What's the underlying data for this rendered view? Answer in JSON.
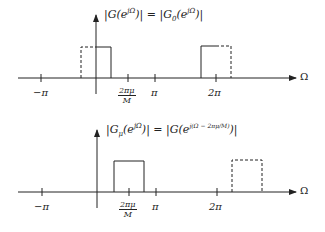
{
  "plots": [
    {
      "title": "|G(e^{jΩ})| = |G_0(e^{jΩ})|",
      "title_left": "|G(e",
      "title_sup": "jΩ",
      "title_mid": ")| = |G",
      "title_sub": "0",
      "title_right_a": "(e",
      "title_right_sup": "jΩ",
      "title_right_b": ")|",
      "axis_label": "Ω",
      "ticks": {
        "neg_pi": "−π",
        "frac_num": "2πμ",
        "frac_den": "M",
        "pi": "π",
        "two_pi": "2π"
      }
    },
    {
      "title": "|G_μ(e^{jΩ})| = |G(e^{j(Ω − 2πμ/M)})|",
      "title_left": "|G",
      "title_sub": "μ",
      "title_a": "(e",
      "title_sup": "jΩ",
      "title_mid": ")| = |G(e",
      "title_sup2": "j(Ω − 2πμ/M)",
      "title_right": ")|",
      "axis_label": "Ω",
      "ticks": {
        "neg_pi": "−π",
        "frac_num": "2πμ",
        "frac_den": "M",
        "pi": "π",
        "two_pi": "2π"
      }
    }
  ],
  "colors": {
    "ink": "#222222",
    "background": "#ffffff"
  }
}
